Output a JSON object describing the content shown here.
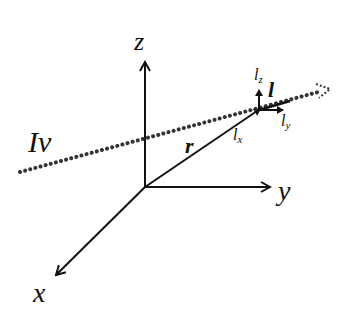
{
  "diagram": {
    "labels": {
      "z": "z",
      "y": "y",
      "x": "x",
      "intensity": "Iν",
      "r": "r",
      "l": "l",
      "lx": "l",
      "lx_sub": "x",
      "ly": "l",
      "ly_sub": "y",
      "lz": "l",
      "lz_sub": "z"
    },
    "colors": {
      "stroke": "#111111",
      "dots": "#333333"
    }
  }
}
